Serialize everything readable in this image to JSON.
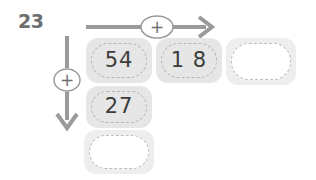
{
  "worksheet": {
    "problem_number": "23",
    "operators": {
      "horizontal": "+",
      "vertical": "+"
    },
    "icons": {
      "horizontal_arrow": "arrow-right-icon",
      "vertical_arrow": "arrow-down-icon",
      "plus_horizontal": "plus-icon",
      "plus_vertical": "plus-icon"
    },
    "colors": {
      "cell_fill": "#e6e6e6",
      "cell_fill_empty": "#eeeeee",
      "cell_border": "#b5b5b5",
      "arrow": "#9a9a9a",
      "text": "#3c3c3c",
      "label": "#6e6e6e",
      "background": "#ffffff"
    },
    "grid": {
      "rows": [
        {
          "cells": [
            {
              "value": "54",
              "empty": false
            },
            {
              "value": "1 8",
              "empty": false
            },
            {
              "value": "",
              "empty": true
            }
          ]
        },
        {
          "cells": [
            {
              "value": "27",
              "empty": false
            }
          ]
        },
        {
          "cells": [
            {
              "value": "",
              "empty": true
            }
          ]
        }
      ]
    }
  }
}
